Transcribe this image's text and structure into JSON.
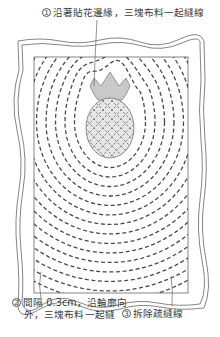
{
  "diagram": {
    "type": "quilting-instruction",
    "labels": [
      {
        "number": "1",
        "text": "沿著貼花邊緣，三塊布料一起縫線"
      },
      {
        "number": "2",
        "line1": "間隔 0.3cm，沿輪廓向",
        "line2": "外，三塊布料一起縫"
      },
      {
        "number": "3",
        "text": "拆除疏縫線"
      }
    ],
    "colors": {
      "line": "#555555",
      "dash": "#4a4a4a",
      "crown_fill": "#c9c9c9",
      "body_fill": "#e6e6e6",
      "background": "#ffffff"
    },
    "echo_line_count": 15,
    "echo_spacing": "0.3cm"
  }
}
